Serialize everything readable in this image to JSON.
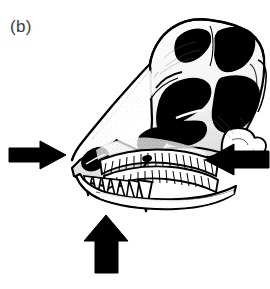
{
  "figure": {
    "panel_label": "(b)",
    "style": "black-and-white-line-drawing-with-stipple-shading",
    "background_color": "#ffffff",
    "ink_color": "#000000",
    "label_color": "#3d3d3d"
  },
  "skull": {
    "name": "skull",
    "orientation": "three-quarter left-facing, snout to lower-left",
    "bounds": {
      "x": 70,
      "y": 18,
      "width": 196,
      "height": 193
    },
    "parts": [
      {
        "name": "cranium-roof",
        "label": "skull roof"
      },
      {
        "name": "antorbital-fenestra",
        "label": "antorbital fenestra",
        "fill": "#000000"
      },
      {
        "name": "orbit",
        "label": "orbit (eye socket)",
        "fill": "#000000"
      },
      {
        "name": "supratemporal-fenestra",
        "label": "supratemporal fenestra",
        "fill": "#000000"
      },
      {
        "name": "infratemporal-fenestra",
        "label": "infratemporal fenestra",
        "fill": "#000000"
      },
      {
        "name": "external-naris",
        "label": "external naris (nostril)",
        "fill": "#000000"
      },
      {
        "name": "premaxilla",
        "label": "premaxilla"
      },
      {
        "name": "maxilla",
        "label": "maxilla"
      },
      {
        "name": "jugal",
        "label": "jugal"
      },
      {
        "name": "quadrate",
        "label": "quadrate"
      },
      {
        "name": "mandible",
        "label": "lower jaw / dentary"
      },
      {
        "name": "upper-tooth-row",
        "label": "upper tooth row",
        "tooth_count": 17
      },
      {
        "name": "lower-tooth-row",
        "label": "lower tooth row",
        "tooth_count": 16
      },
      {
        "name": "premaxillary-teeth",
        "label": "front fang-like teeth",
        "tooth_count": 6
      }
    ]
  },
  "annotations": {
    "arrow_color": "#000000",
    "arrows": [
      {
        "name": "arrow-left",
        "label": "left arrow pointing right at snout",
        "direction": "right",
        "points_at": "premaxilla / snout tip",
        "x": 9,
        "y": 141,
        "width": 57,
        "height": 28
      },
      {
        "name": "arrow-right",
        "label": "right arrow pointing left at jaw joint",
        "direction": "left",
        "points_at": "quadrate / jaw articulation",
        "x": 205,
        "y": 144,
        "width": 64,
        "height": 31
      },
      {
        "name": "arrow-bottom",
        "label": "bottom arrow pointing up at lower jaw",
        "direction": "up",
        "points_at": "mandible ventral margin",
        "x": 84,
        "y": 215,
        "width": 44,
        "height": 58
      }
    ]
  }
}
